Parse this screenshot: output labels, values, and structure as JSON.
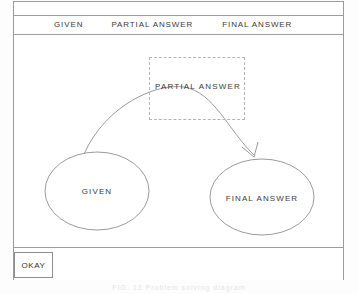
{
  "window": {
    "menubar": {
      "items": [
        {
          "label": "GIVEN",
          "name": "menu-item-given"
        },
        {
          "label": "PARTIAL ANSWER",
          "name": "menu-item-partial-answer"
        },
        {
          "label": "FINAL ANSWER",
          "name": "menu-item-final-answer"
        }
      ]
    },
    "canvas": {
      "nodes": [
        {
          "id": "given",
          "label": "GIVEN",
          "shape": "ellipse",
          "cx": 83,
          "cy": 156,
          "rx": 52,
          "ry": 39
        },
        {
          "id": "final_answer",
          "label": "FINAL ANSWER",
          "shape": "ellipse",
          "cx": 248,
          "cy": 162,
          "rx": 52,
          "ry": 38
        },
        {
          "id": "partial_answer",
          "label": "PARTIAL ANSWER",
          "shape": "dashed-rectangle",
          "x": 135,
          "y": 22,
          "w": 96,
          "h": 63
        }
      ],
      "edges": [
        {
          "from": "given",
          "to": "final_answer",
          "style": "curved-arrow",
          "arrowhead": true
        }
      ]
    },
    "footer": {
      "okay_label": "OKAY"
    }
  },
  "caption": {
    "text": "FIG. 13    Problem solving diagram"
  },
  "colors": {
    "ink": "#3c3c3c",
    "line": "#9a9a9a",
    "dashed": "#b4b4b4",
    "page": "#fdfdfd",
    "window": "#ffffff"
  }
}
